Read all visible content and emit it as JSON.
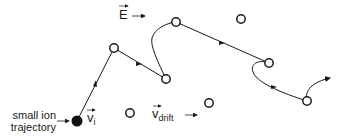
{
  "diagram": {
    "title": "",
    "field_label": {
      "symbol": "E",
      "has_vector_arrow": true,
      "direction": "right"
    },
    "ion_velocity_label": {
      "symbol": "v",
      "subscript": "i",
      "has_vector_arrow": true
    },
    "drift_velocity_label": {
      "symbol": "v",
      "subscript": "drift",
      "has_vector_arrow": true,
      "direction": "right"
    },
    "annotation": {
      "line1": "small ion",
      "line2": "trajectory"
    },
    "start_point": {
      "x": 77,
      "y": 121,
      "filled": true
    },
    "neutral_molecules": [
      {
        "x": 114,
        "y": 48
      },
      {
        "x": 166,
        "y": 79
      },
      {
        "x": 176,
        "y": 22
      },
      {
        "x": 241,
        "y": 19
      },
      {
        "x": 269,
        "y": 63
      },
      {
        "x": 307,
        "y": 101
      },
      {
        "x": 130,
        "y": 113
      },
      {
        "x": 209,
        "y": 103
      }
    ],
    "trajectory_path": "M77,121 L114,48 L166,79 C158,60 150,45 152,38 C156,28 168,24 176,22 L269,63 C258,60 250,64 253,72 C256,82 280,92 307,101 C305,90 312,82 330,78",
    "colors": {
      "stroke": "#1a1a1a",
      "background": "#ffffff"
    }
  }
}
